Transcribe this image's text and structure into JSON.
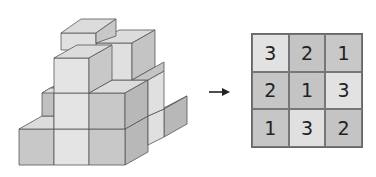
{
  "figure": {
    "arrow": "right-arrow",
    "grid": {
      "rows": [
        [
          {
            "value": "3",
            "color": "#e2e2e2"
          },
          {
            "value": "2",
            "color": "#c4c4c4"
          },
          {
            "value": "1",
            "color": "#c8c8c8"
          }
        ],
        [
          {
            "value": "2",
            "color": "#c6c6c6"
          },
          {
            "value": "1",
            "color": "#c4c4c4"
          },
          {
            "value": "3",
            "color": "#e2e2e2"
          }
        ],
        [
          {
            "value": "1",
            "color": "#c6c6c6"
          },
          {
            "value": "3",
            "color": "#e0e0e0"
          },
          {
            "value": "2",
            "color": "#c4c4c4"
          }
        ]
      ]
    },
    "colors": {
      "front_light": "#e4e4e4",
      "front_dark": "#c8c8c8",
      "side": "#b8b8b8",
      "top": "#dcdcdc",
      "edge": "#555555"
    }
  }
}
